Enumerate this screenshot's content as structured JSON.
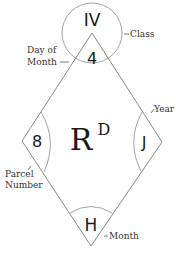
{
  "diagram": {
    "class_value": "IV",
    "day_of_month_value": "4",
    "parcel_number_value": "8",
    "year_value": "J",
    "month_value": "H",
    "center_symbol": "R",
    "center_superscript": "D",
    "labels": {
      "class": "Class",
      "day_of_month_line1": "Day of",
      "day_of_month_line2": "Month",
      "year": "Year",
      "parcel_number_line1": "Parcel",
      "parcel_number_line2": "Number",
      "month": "Month"
    },
    "colors": {
      "line": "#707070",
      "text": "#1a1a1a"
    }
  }
}
